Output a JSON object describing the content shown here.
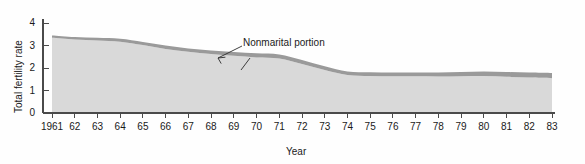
{
  "chart_data": {
    "type": "area",
    "title": "",
    "xlabel": "Year",
    "ylabel": "Total fertility rate",
    "xlim": [
      1961,
      1983
    ],
    "ylim": [
      0,
      4
    ],
    "grid": false,
    "legend_position": "inline-annotations",
    "stacked": true,
    "xtick_labels": [
      "1961",
      "62",
      "63",
      "64",
      "65",
      "66",
      "67",
      "68",
      "69",
      "70",
      "71",
      "72",
      "73",
      "74",
      "75",
      "76",
      "77",
      "78",
      "79",
      "80",
      "81",
      "82",
      "83"
    ],
    "ytick_labels": [
      "0",
      "1",
      "2",
      "3",
      "4"
    ],
    "x": [
      1961,
      1962,
      1963,
      1964,
      1965,
      1966,
      1967,
      1968,
      1969,
      1970,
      1971,
      1972,
      1973,
      1974,
      1975,
      1976,
      1977,
      1978,
      1979,
      1980,
      1981,
      1982,
      1983
    ],
    "series": [
      {
        "name": "Marital portion",
        "color": "#d9d9d9",
        "values": [
          3.34,
          3.27,
          3.22,
          3.17,
          3.02,
          2.85,
          2.72,
          2.62,
          2.54,
          2.47,
          2.42,
          2.18,
          1.91,
          1.69,
          1.64,
          1.63,
          1.63,
          1.62,
          1.63,
          1.64,
          1.61,
          1.58,
          1.55
        ]
      },
      {
        "name": "Nonmarital portion",
        "color": "#9a9a9a",
        "values": [
          0.11,
          0.11,
          0.12,
          0.13,
          0.14,
          0.15,
          0.15,
          0.16,
          0.17,
          0.18,
          0.18,
          0.18,
          0.17,
          0.16,
          0.17,
          0.17,
          0.17,
          0.18,
          0.19,
          0.2,
          0.21,
          0.22,
          0.23
        ]
      }
    ],
    "totals": [
      3.45,
      3.38,
      3.34,
      3.3,
      3.16,
      3.0,
      2.87,
      2.78,
      2.71,
      2.65,
      2.6,
      2.36,
      2.08,
      1.85,
      1.81,
      1.8,
      1.8,
      1.8,
      1.82,
      1.84,
      1.82,
      1.8,
      1.78
    ],
    "annotations": [
      {
        "name": "nonmarital-annotation",
        "text": "Nonmarital portion",
        "x_px": 243,
        "y_px": 41
      },
      {
        "name": "marital-annotation",
        "text": "Marital portion",
        "x_px": 215,
        "y_px": 90
      }
    ]
  },
  "axes": {
    "y_title": "Total fertility rate",
    "x_title": "Year"
  }
}
